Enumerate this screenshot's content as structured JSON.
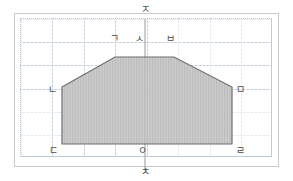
{
  "figure": {
    "title": "",
    "colors": {
      "frame_border": "#c9c9c9",
      "grid_line": "#c3cfdd",
      "axis_line": "#8a8a8a",
      "polygon_stroke": "#6e6e6e",
      "polygon_fill": "#c8c8c8",
      "label_text": "#4a4a4a",
      "background": "#ffffff"
    },
    "axes": {
      "vertical": {
        "top_label": "ㅈ",
        "bottom_label": "ㅊ",
        "x": 145
      },
      "origin_label": "ㅇ"
    },
    "polygon": {
      "type": "hexagon",
      "vertices": [
        {
          "label": "ㄴ",
          "x": 62,
          "y": 87
        },
        {
          "label": "ㄱ",
          "x": 115,
          "y": 57
        },
        {
          "label": "ㅂ",
          "x": 174,
          "y": 57
        },
        {
          "label": "ㅁ",
          "x": 232,
          "y": 87
        },
        {
          "label": "ㄹ",
          "x": 232,
          "y": 144
        },
        {
          "label": "ㄷ",
          "x": 62,
          "y": 144
        }
      ]
    },
    "labels": {
      "top_axis": "ㅈ",
      "bottom_axis": "ㅊ",
      "upper_left": "ㄱ",
      "top_center": "ㅅ",
      "upper_right": "ㅂ",
      "mid_left": "ㄴ",
      "mid_right": "ㅁ",
      "lower_left": "ㄷ",
      "origin": "ㅇ",
      "lower_right": "ㄹ"
    }
  }
}
